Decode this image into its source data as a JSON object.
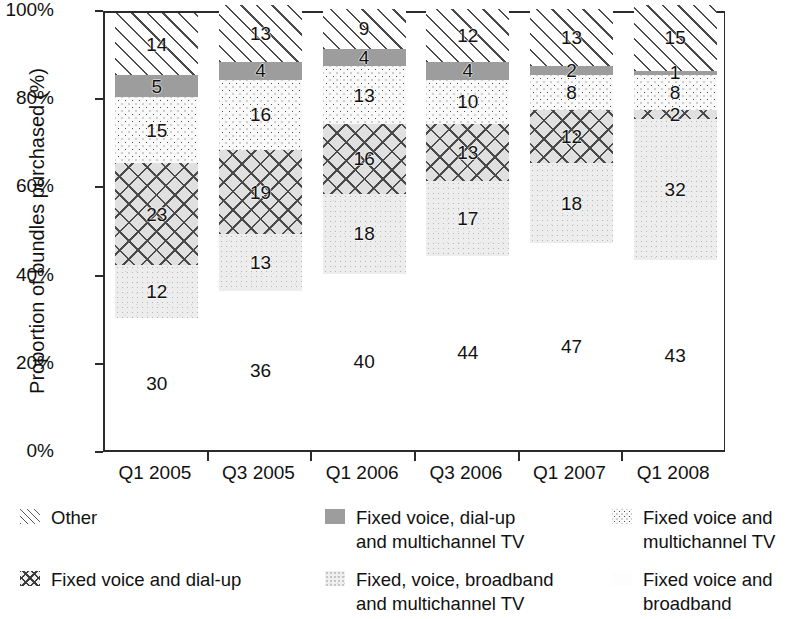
{
  "chart_data": {
    "type": "bar",
    "subtype": "stacked-100-percent",
    "title": "",
    "xlabel": "",
    "ylabel": "Proportion of bundles purchased (%)",
    "ylim": [
      0,
      100
    ],
    "yticks": [
      "0%",
      "20%",
      "40%",
      "60%",
      "80%",
      "100%"
    ],
    "ytick_values": [
      0,
      20,
      40,
      60,
      80,
      100
    ],
    "grid": false,
    "legend_position": "bottom",
    "categories": [
      "Q1 2005",
      "Q3 2005",
      "Q1 2006",
      "Q3 2006",
      "Q1 2007",
      "Q1 2008"
    ],
    "series": [
      {
        "name": "Fixed voice and broadband",
        "pattern": "plain-white",
        "values": [
          30,
          36,
          40,
          44,
          47,
          43
        ]
      },
      {
        "name": "Fixed, voice, broadband and multichannel TV",
        "pattern": "light-speckle",
        "values": [
          12,
          13,
          18,
          17,
          18,
          32
        ]
      },
      {
        "name": "Fixed voice and dial-up",
        "pattern": "cross-hatch",
        "values": [
          23,
          19,
          16,
          13,
          12,
          2
        ]
      },
      {
        "name": "Fixed voice and multichannel TV",
        "pattern": "fine-dots",
        "values": [
          15,
          16,
          13,
          10,
          8,
          8
        ]
      },
      {
        "name": "Fixed voice, dial-up and multichannel TV",
        "pattern": "solid-gray",
        "values": [
          5,
          4,
          4,
          4,
          2,
          1
        ]
      },
      {
        "name": "Other",
        "pattern": "diagonal-hatch",
        "values": [
          14,
          13,
          9,
          12,
          13,
          15
        ]
      }
    ]
  },
  "axis": {
    "y_title": "Proportion of bundles purchased (%)",
    "y_tick_labels": [
      "100%",
      "80%",
      "60%",
      "40%",
      "20%",
      "0%"
    ],
    "x_tick_labels": [
      "Q1 2005",
      "Q3 2005",
      "Q1 2006",
      "Q3 2006",
      "Q1 2007",
      "Q1 2008"
    ]
  },
  "legend": {
    "items": [
      {
        "key": "other",
        "label": "Other",
        "col": 0,
        "row": 0
      },
      {
        "key": "voice-dialup",
        "label": "Fixed voice and dial-up",
        "col": 0,
        "row": 1
      },
      {
        "key": "dialup-mtv",
        "label": "Fixed voice, dial-up\nand multichannel TV",
        "col": 1,
        "row": 0
      },
      {
        "key": "voice-bb-mtv",
        "label": "Fixed, voice, broadband\nand multichannel TV",
        "col": 1,
        "row": 1
      },
      {
        "key": "voice-mtv",
        "label": "Fixed voice and\nmultichannel TV",
        "col": 2,
        "row": 0
      },
      {
        "key": "voice-bb",
        "label": "Fixed voice and\nbroadband",
        "col": 2,
        "row": 1
      }
    ]
  },
  "colors": {
    "axis": "#2b2b2b",
    "text": "#111111",
    "solid_gray": "#9d9d9d",
    "hatch": "#4a4a4a",
    "speckle": "#ededed",
    "plain": "#ffffff"
  },
  "bar_labels": {
    "q1_2005": {
      "bottom": "30",
      "bb_mtv": "12",
      "dialup": "23",
      "mtv": "15",
      "dialup_mtv": "5",
      "other": "14"
    },
    "q3_2005": {
      "bottom": "36",
      "bb_mtv": "13",
      "dialup": "19",
      "mtv": "16",
      "dialup_mtv": "4",
      "other": "13"
    },
    "q1_2006": {
      "bottom": "40",
      "bb_mtv": "18",
      "dialup": "16",
      "mtv": "13",
      "dialup_mtv": "4",
      "other": "9"
    },
    "q3_2006": {
      "bottom": "44",
      "bb_mtv": "17",
      "dialup": "13",
      "mtv": "10",
      "dialup_mtv": "4",
      "other": "12"
    },
    "q1_2007": {
      "bottom": "47",
      "bb_mtv": "18",
      "dialup": "12",
      "mtv": "8",
      "dialup_mtv": "2",
      "other": "13"
    },
    "q1_2008": {
      "bottom": "43",
      "bb_mtv": "32",
      "dialup": "2",
      "mtv": "8",
      "dialup_mtv": "1",
      "other": "15"
    }
  }
}
